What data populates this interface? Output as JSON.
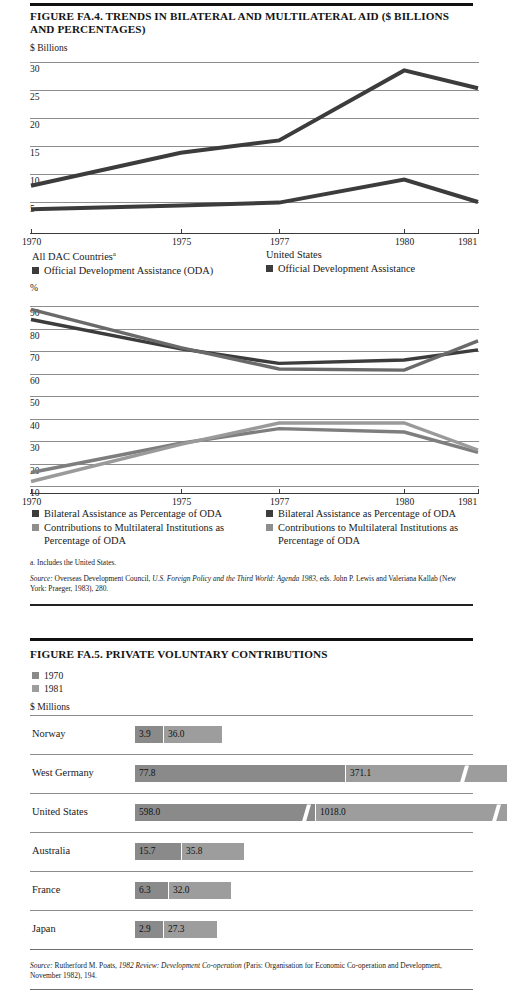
{
  "figure_fa4": {
    "title": "FIGURE FA.4. TRENDS IN BILATERAL AND MULTILATERAL AID ($ BILLIONS AND PERCENTAGES)",
    "unit_label": "$ Billions",
    "unit_label2": "%",
    "legend_top": {
      "left_head": "All DAC Countries",
      "left_head_sup": "a",
      "left_item": "Official Development Assistance (ODA)",
      "right_head": "United States",
      "right_item": "Official Development Assistance"
    },
    "legend_bottom": {
      "left_item1": "Bilateral Assistance as Percentage of ODA",
      "left_item2": "Contributions to Multilateral Institutions as Percentage of ODA",
      "right_item1": "Bilateral Assistance as Percentage of ODA",
      "right_item2": "Contributions to Multilateral Institutions as Percentage of ODA"
    },
    "footnote": "a. Includes the United States.",
    "source_prefix": "Source:",
    "source_text_1": " Overseas Development Council, ",
    "source_italic_1": "U.S. Foreign Policy and the Third World: Agenda 1983",
    "source_text_2": ", eds. John P. Lewis and Valeriana Kallab (New York: Praeger, 1983), 280."
  },
  "figure_fa5": {
    "title": "FIGURE FA.5. PRIVATE VOLUNTARY CONTRIBUTIONS",
    "legend": [
      {
        "label": "1970",
        "color": "#8a8a8a"
      },
      {
        "label": "1981",
        "color": "#9d9d9d"
      }
    ],
    "unit_label": "$ Millions",
    "source_prefix": "Source:",
    "source_text_1": " Rutherford M. Poats, ",
    "source_italic_1": "1982 Review: Development Co-operation",
    "source_text_2": " (Paris: Organisation for Economic Co-operation and Development, November 1982), 194."
  },
  "chart_data": [
    {
      "type": "line",
      "title": "TRENDS IN BILATERAL AND MULTILATERAL AID ($ BILLIONS)",
      "xlabel": "",
      "ylabel": "$ Billions",
      "x": [
        "1970",
        "1975",
        "1977",
        "1980",
        "1981"
      ],
      "ytick_labels": [
        "30",
        "25",
        "20",
        "15",
        "10",
        "5"
      ],
      "ylim": [
        0,
        30
      ],
      "grid": true,
      "legend_position": "below",
      "series": [
        {
          "name": "All DAC Countries - Official Development Assistance (ODA)",
          "color": "#3c3c3c",
          "values": [
            7.9,
            13.8,
            16.0,
            28.5,
            25.3
          ]
        },
        {
          "name": "United States - Official Development Assistance",
          "color": "#3c3c3c",
          "values": [
            3.7,
            4.4,
            4.9,
            9.0,
            5.0
          ]
        }
      ]
    },
    {
      "type": "line",
      "title": "BILATERAL AND MULTILATERAL AID AS PERCENTAGES OF ODA",
      "xlabel": "",
      "ylabel": "%",
      "x": [
        "1970",
        "1975",
        "1977",
        "1980",
        "1981"
      ],
      "ytick_labels": [
        "90",
        "80",
        "70",
        "60",
        "50",
        "40",
        "30",
        "20",
        "10"
      ],
      "ylim": [
        10,
        90
      ],
      "grid": true,
      "legend_position": "below",
      "series": [
        {
          "name": "All DAC Countries - Bilateral Assistance as Percentage of ODA",
          "color": "#3c3c3c",
          "values": [
            84.0,
            71.0,
            64.5,
            66.0,
            70.5
          ]
        },
        {
          "name": "All DAC Countries - Contributions to Multilateral Institutions as Percentage of ODA",
          "color": "#7e7e7e",
          "values": [
            16.0,
            29.0,
            35.5,
            34.0,
            25.0
          ]
        },
        {
          "name": "United States - Bilateral Assistance as Percentage of ODA",
          "color": "#6a6a6a",
          "values": [
            88.5,
            71.5,
            62.0,
            61.5,
            74.5
          ]
        },
        {
          "name": "United States - Contributions to Multilateral Institutions as Percentage of ODA",
          "color": "#9a9a9a",
          "values": [
            12.0,
            28.5,
            38.0,
            38.0,
            26.0
          ]
        }
      ]
    },
    {
      "type": "bar",
      "orientation": "horizontal",
      "title": "PRIVATE VOLUNTARY CONTRIBUTIONS",
      "xlabel": "$ Millions",
      "ylabel": "",
      "categories": [
        "Norway",
        "West Germany",
        "United States",
        "Australia",
        "France",
        "Japan"
      ],
      "series": [
        {
          "name": "1970",
          "color": "#8a8a8a",
          "values": [
            3.9,
            77.8,
            598.0,
            15.7,
            6.3,
            2.9
          ]
        },
        {
          "name": "1981",
          "color": "#9d9d9d",
          "values": [
            36.0,
            371.1,
            1018.0,
            35.8,
            32.0,
            27.3
          ]
        }
      ],
      "note": "Bars for West Germany and United States are drawn with scale-break marks."
    }
  ],
  "bar_rows": [
    {
      "label": "Norway",
      "v1970": "3.9",
      "v1981": "36.0",
      "w1970": 28,
      "w1981": 58,
      "brk": false
    },
    {
      "label": "West Germany",
      "v1970": "77.8",
      "v1981": "371.1",
      "w1970": 210,
      "w1981": 161,
      "brk": true
    },
    {
      "label": "United States",
      "v1970": "598.0",
      "v1981": "1018.0",
      "w1970": 180,
      "w1981": 191,
      "brk": true
    },
    {
      "label": "Australia",
      "v1970": "15.7",
      "v1981": "35.8",
      "w1970": 46,
      "w1981": 62,
      "brk": false
    },
    {
      "label": "France",
      "v1970": "6.3",
      "v1981": "32.0",
      "w1970": 33,
      "w1981": 62,
      "brk": false
    },
    {
      "label": "Japan",
      "v1970": "2.9",
      "v1981": "27.3",
      "w1970": 28,
      "w1981": 53,
      "brk": false
    }
  ]
}
